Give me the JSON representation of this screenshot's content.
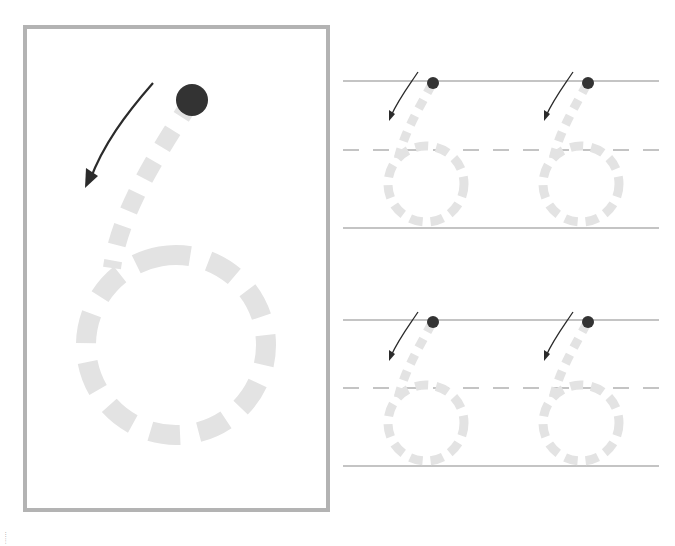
{
  "worksheet": {
    "subject": "number-tracing",
    "digit": "6",
    "colors": {
      "frame_border": "#b3b3b3",
      "trace_dash": "#e3e3e3",
      "start_dot": "#333333",
      "arrow": "#2b2b2b",
      "guide_line": "#8a8a8a"
    },
    "model": {
      "label": "Large model digit 6 with start dot and direction arrow"
    },
    "practice_rows": [
      {
        "row": 1,
        "repetitions": 2
      },
      {
        "row": 2,
        "repetitions": 2
      }
    ],
    "side_label": "......"
  }
}
